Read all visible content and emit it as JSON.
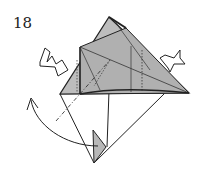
{
  "diagram": {
    "step_number": "18",
    "colors": {
      "paper_colored": "#b8b8b8",
      "paper_white": "#ffffff",
      "line": "#222222"
    },
    "symbols": [
      {
        "name": "push-arrow-left",
        "meaning": "push in / squash from left"
      },
      {
        "name": "push-arrow-right",
        "meaning": "push in / squash from right"
      },
      {
        "name": "curved-fold-arrow",
        "meaning": "fold flap over"
      },
      {
        "name": "valley-fold-line",
        "meaning": "dash-dot fold line"
      }
    ]
  }
}
